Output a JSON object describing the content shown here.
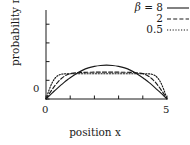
{
  "figure": {
    "background": "#ffffff",
    "ink": "#1a1a1a"
  },
  "axes": {
    "xlabel": "position x",
    "ylabel": "probability π(x)",
    "x_ticklabels": [
      "0",
      "5"
    ],
    "y_ticklabels": [
      "0"
    ]
  },
  "legend": {
    "title_symbol": "β =",
    "entries": [
      {
        "label": "8",
        "style": "solid"
      },
      {
        "label": "2",
        "style": "dashed"
      },
      {
        "label": "0.5",
        "style": "dotted"
      }
    ]
  },
  "chart_data": {
    "type": "line",
    "title": "",
    "subtitle": "",
    "xlabel": "position x",
    "ylabel": "probability π(x)",
    "xlim": [
      0,
      5
    ],
    "ylim": [
      0,
      0.46
    ],
    "xticks": [
      0,
      1,
      2,
      3,
      4,
      5
    ],
    "xticklabels": [
      "0",
      "",
      "",
      "",
      "",
      "5"
    ],
    "yticks": [
      0,
      0.1,
      0.2,
      0.3,
      0.4
    ],
    "yticklabels": [
      "0",
      "",
      "",
      "",
      ""
    ],
    "grid": false,
    "legend_position": "upper right",
    "legend_title": "β =",
    "x": [
      0,
      0.125,
      0.25,
      0.375,
      0.5,
      0.625,
      0.75,
      0.875,
      1,
      1.25,
      1.5,
      1.75,
      2,
      2.25,
      2.5,
      2.75,
      3,
      3.25,
      3.5,
      3.75,
      4,
      4.125,
      4.25,
      4.375,
      4.5,
      4.625,
      4.75,
      4.875,
      5
    ],
    "series": [
      {
        "name": "8",
        "style": "solid",
        "color": "#1a1a1a",
        "values": [
          0,
          0.0157,
          0.0312,
          0.0463,
          0.0611,
          0.0754,
          0.089,
          0.1019,
          0.114,
          0.1356,
          0.1532,
          0.1663,
          0.1745,
          0.1794,
          0.1809,
          0.1794,
          0.1745,
          0.1663,
          0.1532,
          0.1356,
          0.114,
          0.1019,
          0.089,
          0.0754,
          0.0611,
          0.0463,
          0.0312,
          0.0157,
          0
        ]
      },
      {
        "name": "2",
        "style": "dashed",
        "color": "#1a1a1a",
        "values": [
          0,
          0.0258,
          0.0503,
          0.0726,
          0.0921,
          0.1082,
          0.1208,
          0.1299,
          0.1357,
          0.1404,
          0.1423,
          0.1431,
          0.1434,
          0.1435,
          0.1435,
          0.1435,
          0.1434,
          0.1431,
          0.1423,
          0.1404,
          0.1357,
          0.1299,
          0.1208,
          0.1082,
          0.0921,
          0.0726,
          0.0503,
          0.0258,
          0
        ]
      },
      {
        "name": "0.5",
        "style": "dotted",
        "color": "#1a1a1a",
        "values": [
          0,
          0.0474,
          0.0856,
          0.1114,
          0.1258,
          0.1322,
          0.1346,
          0.1351,
          0.1352,
          0.1352,
          0.1352,
          0.1352,
          0.1352,
          0.1352,
          0.1352,
          0.1352,
          0.1352,
          0.1352,
          0.1352,
          0.1352,
          0.1352,
          0.1351,
          0.1346,
          0.1322,
          0.1258,
          0.1114,
          0.0856,
          0.0474,
          0
        ]
      }
    ]
  }
}
